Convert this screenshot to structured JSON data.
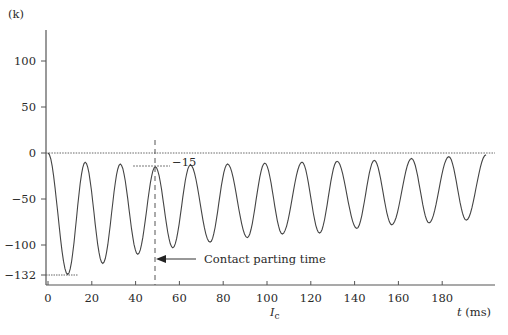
{
  "chart_data": {
    "type": "line",
    "title": "",
    "ylabel": "(k)",
    "xlabel": "t (ms)",
    "current_label": "I",
    "current_label_sub": "c",
    "xlim": [
      0,
      200
    ],
    "ylim": [
      -132,
      130
    ],
    "x_ticks": [
      0,
      20,
      40,
      60,
      80,
      100,
      120,
      140,
      160,
      180
    ],
    "y_ticks": [
      100,
      50,
      0,
      -50,
      -100,
      -132
    ],
    "grid": false,
    "zero_line": "dotted",
    "annotations": [
      {
        "text": "Contact parting time",
        "x": 49,
        "type": "arrow-to-dashed-vertical-line"
      },
      {
        "text": "-15",
        "x": 49,
        "y": -15,
        "type": "peak-marker"
      },
      {
        "text": "-132",
        "x": 9,
        "y": -132,
        "type": "min-marker"
      }
    ],
    "series": [
      {
        "name": "Ic",
        "description": "Asymmetrical decaying oscillating current, ~60 Hz",
        "peaks": [
          {
            "t": 0,
            "v": 0
          },
          {
            "t": 17,
            "v": -10
          },
          {
            "t": 33,
            "v": -12
          },
          {
            "t": 49,
            "v": -15
          },
          {
            "t": 65,
            "v": -13
          },
          {
            "t": 82,
            "v": -12
          },
          {
            "t": 99,
            "v": -11
          },
          {
            "t": 116,
            "v": -10
          },
          {
            "t": 132,
            "v": -9
          },
          {
            "t": 149,
            "v": -8
          },
          {
            "t": 166,
            "v": -6
          },
          {
            "t": 183,
            "v": -4
          }
        ],
        "troughs": [
          {
            "t": 9,
            "v": -132
          },
          {
            "t": 25,
            "v": -120
          },
          {
            "t": 41,
            "v": -110
          },
          {
            "t": 57,
            "v": -103
          },
          {
            "t": 74,
            "v": -97
          },
          {
            "t": 91,
            "v": -92
          },
          {
            "t": 107,
            "v": -88
          },
          {
            "t": 124,
            "v": -87
          },
          {
            "t": 141,
            "v": -82
          },
          {
            "t": 157,
            "v": -78
          },
          {
            "t": 174,
            "v": -76
          },
          {
            "t": 191,
            "v": -73
          }
        ],
        "end": {
          "t": 200,
          "v": -2
        }
      }
    ]
  },
  "labels": {
    "y_unit": "(k)",
    "x_unit": "t (ms)",
    "contact_parting": "Contact parting time",
    "peak_value": "−15",
    "min_value": "−132",
    "ic_main": "I",
    "ic_sub": "c"
  },
  "y_tick_labels": [
    "100",
    "50",
    "0",
    "−50",
    "−100",
    "−132"
  ],
  "x_tick_labels": [
    "0",
    "20",
    "40",
    "60",
    "80",
    "100",
    "120",
    "140",
    "160",
    "180"
  ],
  "colors": {
    "line": "#444444",
    "axis": "#555555",
    "text": "#2a2a2a"
  }
}
